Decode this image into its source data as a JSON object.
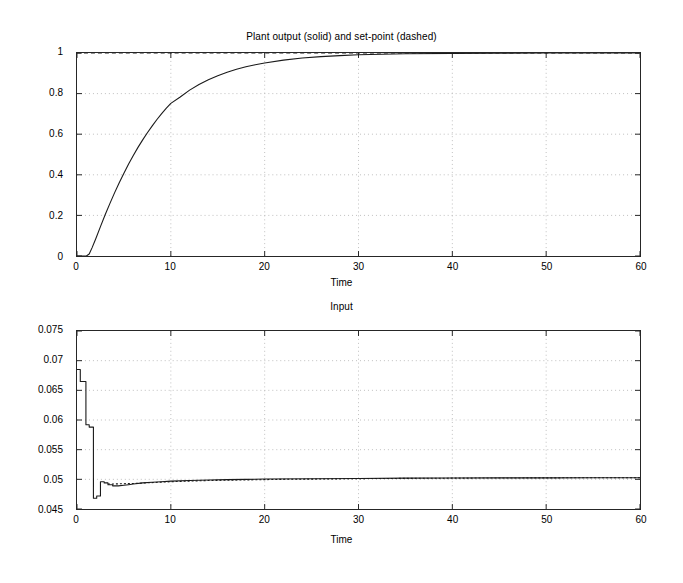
{
  "figure": {
    "background": "#ffffff",
    "line_color": "#1a1a1a",
    "grid_color": "#b0b0b0",
    "axis_color": "#262626",
    "width": 683,
    "height": 583
  },
  "chart_data": [
    {
      "id": "plant-output",
      "type": "line",
      "title": "Plant output (solid) and set-point (dashed)",
      "xlabel": "Time",
      "ylabel": "",
      "xlim": [
        0,
        60
      ],
      "ylim": [
        0,
        1
      ],
      "grid": true,
      "legend": "none",
      "xticks": [
        0,
        10,
        20,
        30,
        40,
        50,
        60
      ],
      "xtick_labels": [
        "0",
        "10",
        "20",
        "30",
        "40",
        "50",
        "60"
      ],
      "yticks": [
        0,
        0.2,
        0.4,
        0.6,
        0.8,
        1
      ],
      "ytick_labels": [
        "0",
        "0.2",
        "0.4",
        "0.6",
        "0.8",
        "1"
      ],
      "series": [
        {
          "name": "Plant output",
          "style": "solid",
          "x": [
            0,
            0.5,
            1.0,
            1.3,
            1.6,
            2.0,
            2.5,
            3.0,
            3.5,
            4.0,
            4.5,
            5.0,
            5.5,
            6.0,
            6.5,
            7.0,
            7.5,
            8.0,
            8.5,
            9.0,
            9.5,
            10.0,
            11.0,
            12.0,
            13.0,
            14.0,
            15.0,
            16.0,
            17.0,
            18.0,
            19.0,
            20.0,
            22.0,
            24.0,
            26.0,
            28.0,
            30.0,
            35.0,
            40.0,
            45.0,
            50.0,
            55.0,
            60.0
          ],
          "y": [
            0,
            0,
            0,
            0.01,
            0.04,
            0.085,
            0.145,
            0.203,
            0.258,
            0.311,
            0.361,
            0.408,
            0.453,
            0.495,
            0.535,
            0.572,
            0.607,
            0.64,
            0.671,
            0.7,
            0.727,
            0.752,
            0.783,
            0.817,
            0.845,
            0.868,
            0.888,
            0.905,
            0.92,
            0.932,
            0.942,
            0.951,
            0.965,
            0.975,
            0.982,
            0.987,
            0.991,
            0.996,
            0.998,
            0.999,
            1.0,
            1.0,
            1.0
          ]
        },
        {
          "name": "Set-point",
          "style": "dashed",
          "x": [
            0,
            60
          ],
          "y": [
            1,
            1
          ]
        }
      ]
    },
    {
      "id": "input",
      "type": "line",
      "title": "Input",
      "xlabel": "Time",
      "ylabel": "",
      "xlim": [
        0,
        60
      ],
      "ylim": [
        0.045,
        0.075
      ],
      "grid": true,
      "legend": "none",
      "xticks": [
        0,
        10,
        20,
        30,
        40,
        50,
        60
      ],
      "xtick_labels": [
        "0",
        "10",
        "20",
        "30",
        "40",
        "50",
        "60"
      ],
      "yticks": [
        0.045,
        0.05,
        0.055,
        0.06,
        0.065,
        0.07,
        0.075
      ],
      "ytick_labels": [
        "0.045",
        "0.05",
        "0.055",
        "0.06",
        "0.065",
        "0.07",
        "0.075"
      ],
      "series": [
        {
          "name": "Input",
          "style": "solid-staircase",
          "x": [
            0,
            0.35,
            0.35,
            0.95,
            0.95,
            1.3,
            1.3,
            1.75,
            1.75,
            2.1,
            2.1,
            2.5,
            2.5,
            2.9,
            2.9,
            3.3,
            3.3,
            3.8,
            3.8,
            4.4,
            4.4,
            5.0,
            5.5,
            6.0,
            7.0,
            8.0,
            9.0,
            10.0,
            12.0,
            14.0,
            16.0,
            18.0,
            20.0,
            25.0,
            30.0,
            35.0,
            40.0,
            45.0,
            50.0,
            55.0,
            60.0
          ],
          "y": [
            0.0685,
            0.0685,
            0.0665,
            0.0665,
            0.0592,
            0.0592,
            0.0588,
            0.0588,
            0.0468,
            0.0468,
            0.0472,
            0.0472,
            0.0496,
            0.0496,
            0.0494,
            0.0494,
            0.0491,
            0.0491,
            0.0489,
            0.0489,
            0.0489,
            0.049,
            0.0491,
            0.0492,
            0.0494,
            0.0495,
            0.0496,
            0.0497,
            0.0498,
            0.0499,
            0.04995,
            0.05,
            0.05005,
            0.0501,
            0.05015,
            0.0502,
            0.05022,
            0.05024,
            0.05025,
            0.05026,
            0.05027
          ]
        },
        {
          "name": "Input reference",
          "style": "dotted-overlay",
          "x": [
            3.3,
            6,
            10,
            14,
            18,
            22,
            26,
            30,
            40,
            50,
            60
          ],
          "y": [
            0.0492,
            0.0493,
            0.0496,
            0.0498,
            0.0499,
            0.05,
            0.05005,
            0.05012,
            0.0502,
            0.05025,
            0.05027
          ]
        }
      ]
    }
  ]
}
